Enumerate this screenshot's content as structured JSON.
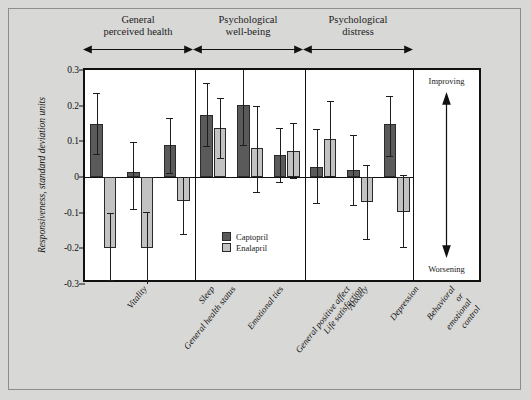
{
  "figure": {
    "background_color": "#d8d8d6",
    "plot_background_color": "#ffffff",
    "captopril_color": "#5a5a5a",
    "enalapril_color": "#c2c2c2"
  },
  "side_panel": {
    "improving_label": "Improving",
    "worsening_label": "Worsening"
  },
  "legend": {
    "captopril_label": "Captopril",
    "enalapril_label": "Enalapril"
  },
  "groups": [
    {
      "label": "General\nperceived health"
    },
    {
      "label": "Psychological\nwell-being"
    },
    {
      "label": "Psychological\ndistress"
    }
  ],
  "chart_data": {
    "type": "bar",
    "title": "",
    "xlabel": "",
    "ylabel": "Responsiveness, standard deviation units",
    "ylim": [
      -0.3,
      0.3
    ],
    "yticks": [
      "0.3",
      "0.2",
      "0.1",
      "0",
      "-0.1",
      "-0.2",
      "-0.3"
    ],
    "ytick_values": [
      0.3,
      0.2,
      0.1,
      0,
      -0.1,
      -0.2,
      -0.3
    ],
    "grid": false,
    "legend_position": "inside-bottom-center",
    "error_bars": "95% confidence interval",
    "categories": [
      "Vitality",
      "General health status",
      "Sleep",
      "Emotional ties",
      "General positive affect",
      "Life satisfaction",
      "Anxiety",
      "Depression",
      "Behavioral or\nemotional control"
    ],
    "category_groups": [
      "General perceived health",
      "General perceived health",
      "General perceived health",
      "Psychological well-being",
      "Psychological well-being",
      "Psychological well-being",
      "Psychological distress",
      "Psychological distress",
      "Psychological distress"
    ],
    "series": [
      {
        "name": "Captopril",
        "color": "#5a5a5a",
        "values": [
          0.15,
          0.013,
          0.089,
          0.175,
          0.201,
          0.062,
          0.028,
          0.021,
          0.149
        ],
        "err_low": [
          0.065,
          -0.089,
          0.011,
          0.086,
          0.09,
          -0.013,
          -0.072,
          -0.078,
          0.06
        ],
        "err_high": [
          0.235,
          0.098,
          0.166,
          0.264,
          0.308,
          0.136,
          0.135,
          0.118,
          0.228
        ]
      },
      {
        "name": "Enalapril",
        "color": "#c2c2c2",
        "values": [
          -0.199,
          -0.198,
          -0.068,
          0.136,
          0.081,
          0.072,
          0.107,
          -0.069,
          -0.097
        ],
        "err_low": [
          -0.289,
          -0.3,
          -0.159,
          0.052,
          -0.042,
          -0.004,
          0.002,
          -0.173,
          -0.195
        ],
        "err_high": [
          -0.101,
          -0.098,
          0.0,
          0.221,
          0.199,
          0.152,
          0.212,
          0.035,
          0.005
        ]
      }
    ]
  }
}
